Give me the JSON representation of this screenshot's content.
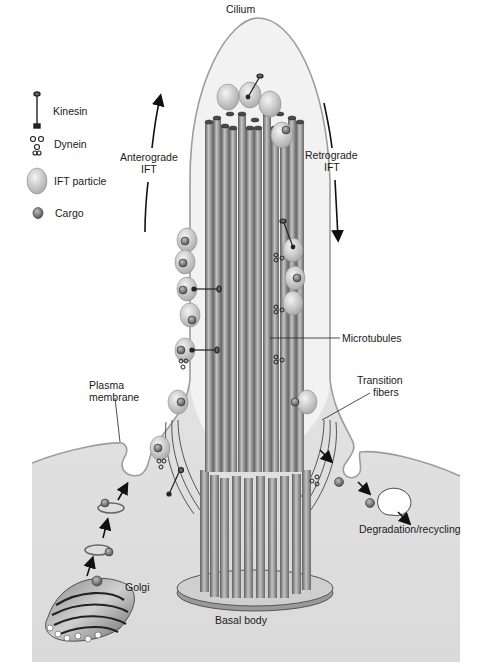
{
  "legend": {
    "items": [
      {
        "icon": "kinesin-icon",
        "label": "Kinesin"
      },
      {
        "icon": "dynein-icon",
        "label": "Dynein"
      },
      {
        "icon": "ift-particle-icon",
        "label": "IFT particle"
      },
      {
        "icon": "cargo-icon",
        "label": "Cargo"
      }
    ]
  },
  "labels": {
    "cilium": "Cilium",
    "anterograde_1": "Anterograde",
    "anterograde_2": "IFT",
    "retrograde_1": "Retrograde",
    "retrograde_2": "IFT",
    "microtubules": "Microtubules",
    "transition_1": "Transition",
    "transition_2": "fibers",
    "plasma_1": "Plasma",
    "plasma_2": "membrane",
    "golgi": "Golgi",
    "degradation": "Degradation/recycling",
    "basal_body": "Basal body"
  },
  "colors": {
    "cytoplasm": "#e4e4e4",
    "membrane": "#9a9a9a",
    "tubule_dark": "#6e6e6e",
    "tubule_light": "#b8b8b8",
    "particle": "#d6d6d6",
    "cargo": "#7a7a7a"
  }
}
